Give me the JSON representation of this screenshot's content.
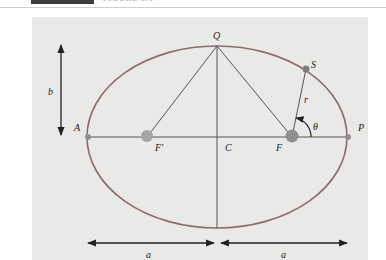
{
  "header": {
    "caption": "FIGURE 3.1"
  },
  "diagram": {
    "colors": {
      "panel": "#e9e9e7",
      "ellipse": "#8c6a72",
      "lines": "#555555",
      "focus_fill": "#9a9a9a",
      "point_fill": "#8a8a8a",
      "arrows": "#222222"
    },
    "labels": {
      "Q": "Q",
      "S": "S",
      "r": "r",
      "theta": "θ",
      "A": "A",
      "P": "P",
      "F_prime": "F′",
      "C": "C",
      "F": "F",
      "b": "b",
      "a_left": "a",
      "a_right": "a"
    },
    "points": {
      "center_C": [
        217,
        137
      ],
      "A": [
        88,
        137
      ],
      "P": [
        348,
        137
      ],
      "Q": [
        217,
        46
      ],
      "bottom": [
        217,
        228
      ],
      "F_prime": [
        147,
        137
      ],
      "F": [
        292,
        137
      ],
      "S": [
        306,
        69
      ]
    },
    "semi_major_a": 130,
    "semi_minor_b": 91
  }
}
